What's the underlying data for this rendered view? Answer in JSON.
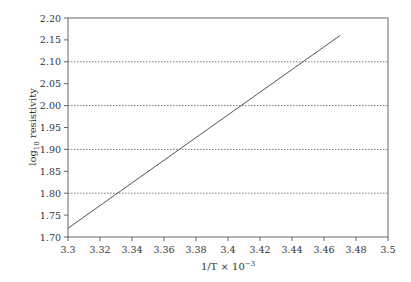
{
  "chart_data": {
    "type": "line",
    "title": "",
    "xlabel": "1/T × 10",
    "xlabel_exponent": "−3",
    "ylabel_prefix": "log",
    "ylabel_subscript": "10",
    "ylabel_suffix": " resistivity",
    "xlim": [
      3.3,
      3.5
    ],
    "ylim": [
      1.7,
      2.2
    ],
    "x_ticks": [
      "3.3",
      "3.32",
      "3.34",
      "3.36",
      "3.38",
      "3.4",
      "3.42",
      "3.44",
      "3.46",
      "3.48",
      "3.5"
    ],
    "y_ticks": [
      "1.70",
      "1.75",
      "1.80",
      "1.85",
      "1.90",
      "1.95",
      "2.00",
      "2.05",
      "2.10",
      "2.15",
      "2.20"
    ],
    "gridlines_y": [
      1.8,
      1.9,
      2.0,
      2.1
    ],
    "grid": "dotted horizontal at 0.10 intervals",
    "legend": null,
    "series": [
      {
        "name": "log10 resistivity",
        "x": [
          3.3,
          3.47
        ],
        "y": [
          1.72,
          2.16
        ]
      }
    ],
    "colors": {
      "line": "#555555",
      "axis": "#666666",
      "grid": "#777777"
    }
  }
}
